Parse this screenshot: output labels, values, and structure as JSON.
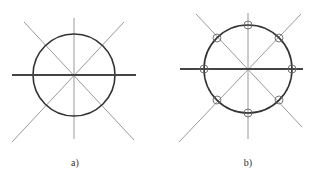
{
  "figures": [
    {
      "label": "a)",
      "center": [
        74,
        75
      ],
      "radius": 41,
      "markers": 0
    },
    {
      "label": "b)",
      "center": [
        248,
        69
      ],
      "radius": 44,
      "markers": 8
    }
  ],
  "colors": {
    "circle": "#333333",
    "axis": "#444444",
    "thin_line": "#9a9a9a"
  }
}
